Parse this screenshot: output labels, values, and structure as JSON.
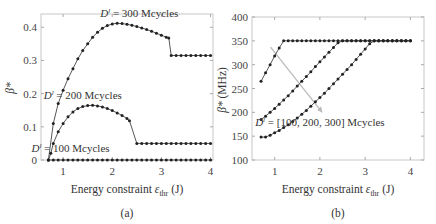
{
  "chart_data": [
    {
      "panel": "(a)",
      "type": "line",
      "title": "",
      "xlabel": "Energy constraint ε_thr (J)",
      "ylabel": "β*",
      "xlim": [
        0.55,
        4.05
      ],
      "ylim": [
        0,
        0.44
      ],
      "xticks": [
        1,
        2,
        3,
        4
      ],
      "yticks": [
        0,
        0.1,
        0.2,
        0.3,
        0.4
      ],
      "ytick_labels": [
        "0",
        "0.1",
        "0.2",
        "0.3",
        "0.4"
      ],
      "grid": false,
      "series": [
        {
          "name": "D^l = 300 Mcycles",
          "x": [
            0.7,
            0.8,
            0.9,
            1.0,
            1.1,
            1.2,
            1.3,
            1.4,
            1.5,
            1.6,
            1.7,
            1.8,
            1.9,
            2.0,
            2.1,
            2.2,
            2.3,
            2.4,
            2.5,
            2.6,
            2.7,
            2.8,
            2.9,
            3.0,
            3.1,
            3.15,
            3.2,
            3.3,
            3.4,
            3.5,
            3.6,
            3.7,
            3.8,
            3.9,
            4.0
          ],
          "y": [
            0.0,
            0.11,
            0.17,
            0.21,
            0.245,
            0.275,
            0.305,
            0.33,
            0.35,
            0.37,
            0.385,
            0.397,
            0.405,
            0.41,
            0.412,
            0.411,
            0.409,
            0.406,
            0.402,
            0.398,
            0.393,
            0.388,
            0.382,
            0.376,
            0.37,
            0.368,
            0.315,
            0.315,
            0.315,
            0.315,
            0.315,
            0.315,
            0.315,
            0.315,
            0.315
          ]
        },
        {
          "name": "D^l = 200 Mcycles",
          "x": [
            0.7,
            0.75,
            0.8,
            0.9,
            1.0,
            1.1,
            1.2,
            1.3,
            1.4,
            1.5,
            1.6,
            1.7,
            1.8,
            1.9,
            2.0,
            2.1,
            2.2,
            2.3,
            2.35,
            2.5,
            2.6,
            2.7,
            2.8,
            2.9,
            3.0,
            3.1,
            3.2,
            3.3,
            3.4,
            3.5,
            3.6,
            3.7,
            3.8,
            3.9,
            4.0
          ],
          "y": [
            0.0,
            0.02,
            0.05,
            0.085,
            0.11,
            0.13,
            0.145,
            0.155,
            0.161,
            0.164,
            0.165,
            0.163,
            0.16,
            0.155,
            0.149,
            0.142,
            0.134,
            0.125,
            0.118,
            0.05,
            0.05,
            0.05,
            0.05,
            0.05,
            0.05,
            0.05,
            0.05,
            0.05,
            0.05,
            0.05,
            0.05,
            0.05,
            0.05,
            0.05,
            0.05
          ]
        },
        {
          "name": "D^l = 100 Mcycles",
          "x": [
            0.7,
            0.8,
            0.9,
            1.0,
            1.1,
            1.2,
            1.3,
            1.4,
            1.5,
            1.6,
            1.7,
            1.8,
            1.9,
            2.0,
            2.1,
            2.2,
            2.3,
            2.4,
            2.5,
            2.6,
            2.7,
            2.8,
            2.9,
            3.0,
            3.1,
            3.2,
            3.3,
            3.4,
            3.5,
            3.6,
            3.7,
            3.8,
            3.9,
            4.0
          ],
          "y": [
            0.0,
            0.0,
            0.0,
            0.0,
            0.0,
            0.0,
            0.0,
            0.0,
            0.0,
            0.0,
            0.0,
            0.0,
            0.0,
            0.0,
            0.0,
            0.0,
            0.0,
            0.0,
            0.0,
            0.0,
            0.0,
            0.0,
            0.0,
            0.0,
            0.0,
            0.0,
            0.0,
            0.0,
            0.0,
            0.0,
            0.0,
            0.0,
            0.0,
            0.0
          ]
        }
      ],
      "annotations": [
        {
          "text_prefix": "D",
          "sup": "l",
          "text_suffix": " = 300 Mcycles",
          "x": 2.55,
          "y": 0.43
        },
        {
          "text_prefix": "D",
          "sup": "l",
          "text_suffix": " = 200 Mcycles",
          "x": 1.4,
          "y": 0.185
        },
        {
          "text_prefix": "D",
          "sup": "l",
          "text_suffix": " = 100 Mcycles",
          "x": 1.15,
          "y": 0.025
        }
      ],
      "caption": "(a)"
    },
    {
      "panel": "(b)",
      "type": "line",
      "title": "",
      "xlabel": "Energy constraint ε_thr (J)",
      "ylabel": "β* (MHz)",
      "xlim": [
        0.5,
        4.3
      ],
      "ylim": [
        100,
        400
      ],
      "xticks": [
        1,
        2,
        3,
        4
      ],
      "yticks": [
        100,
        150,
        200,
        250,
        300,
        350,
        400
      ],
      "grid": false,
      "series": [
        {
          "name": "D^l = 100 Mcycles",
          "x": [
            0.7,
            0.8,
            0.9,
            1.0,
            1.1,
            1.2,
            1.3,
            1.4,
            1.5,
            1.6,
            1.7,
            1.8,
            1.9,
            2.0,
            2.1,
            2.2,
            2.3,
            2.4,
            2.5,
            2.6,
            2.7,
            2.8,
            2.9,
            3.0,
            3.1,
            3.2,
            3.3,
            3.4,
            3.5,
            3.6,
            3.7,
            3.8,
            3.9,
            4.0
          ],
          "y": [
            265,
            283,
            300,
            318,
            335,
            350,
            350,
            350,
            350,
            350,
            350,
            350,
            350,
            350,
            350,
            350,
            350,
            350,
            350,
            350,
            350,
            350,
            350,
            350,
            350,
            350,
            350,
            350,
            350,
            350,
            350,
            350,
            350,
            350
          ]
        },
        {
          "name": "D^l = 200 Mcycles",
          "x": [
            0.7,
            0.8,
            0.9,
            1.0,
            1.1,
            1.2,
            1.3,
            1.4,
            1.5,
            1.6,
            1.7,
            1.8,
            1.9,
            2.0,
            2.1,
            2.2,
            2.3,
            2.4,
            2.5,
            2.6,
            2.7,
            2.8,
            2.9,
            3.0,
            3.1,
            3.2,
            3.3,
            3.4,
            3.5,
            3.6,
            3.7,
            3.8,
            3.9,
            4.0
          ],
          "y": [
            185,
            192,
            200,
            208,
            217,
            226,
            235,
            245,
            255,
            265,
            275,
            285,
            296,
            306,
            316,
            326,
            336,
            346,
            350,
            350,
            350,
            350,
            350,
            350,
            350,
            350,
            350,
            350,
            350,
            350,
            350,
            350,
            350,
            350
          ]
        },
        {
          "name": "D^l = 300 Mcycles",
          "x": [
            0.7,
            0.8,
            0.9,
            1.0,
            1.1,
            1.2,
            1.3,
            1.4,
            1.5,
            1.6,
            1.7,
            1.8,
            1.9,
            2.0,
            2.1,
            2.2,
            2.3,
            2.4,
            2.5,
            2.6,
            2.7,
            2.8,
            2.9,
            3.0,
            3.1,
            3.2,
            3.3,
            3.4,
            3.5,
            3.6,
            3.7,
            3.8,
            3.9,
            4.0
          ],
          "y": [
            148,
            148,
            152,
            157,
            162,
            168,
            174,
            181,
            188,
            196,
            204,
            213,
            222,
            231,
            240,
            250,
            260,
            270,
            280,
            290,
            300,
            311,
            322,
            333,
            344,
            350,
            350,
            350,
            350,
            350,
            350,
            350,
            350,
            350
          ]
        }
      ],
      "arrow": {
        "from": [
          0.91,
          337
        ],
        "to": [
          2.05,
          200
        ]
      },
      "annotations": [
        {
          "text_prefix": "D",
          "sup": "l",
          "text_suffix": " = [100, 200, 300] Mcycles",
          "x": 2.0,
          "y": 172
        }
      ],
      "caption": "(b)"
    }
  ],
  "labels": {
    "left_ylabel": "β*",
    "right_ylabel": "β* (MHz)",
    "xlabel_main": "Energy constraint ε",
    "xlabel_sub": "thr",
    "xlabel_unit": " (J)",
    "caption_a": "(a)",
    "caption_b": "(b)"
  }
}
